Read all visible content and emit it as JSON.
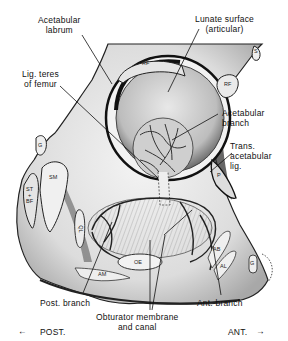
{
  "figure": {
    "labels": {
      "acetabular_labrum": "Acetabular\nlabrum",
      "lunate_surface": "Lunate surface\n(articular)",
      "lig_teres": "Lig. teres\nof femur",
      "acetabular_branch": "Acetabular\nbranch",
      "trans_acetabular_lig": "Trans.\nacetabular\nlig.",
      "post_branch": "Post. branch",
      "obturator_membrane": "Obturator membrane\nand canal",
      "ant_branch": "Ant. branch"
    },
    "muscle_abbreviations": {
      "rf_upper": "RF",
      "rf_right": "RF",
      "s": "S",
      "g": "G",
      "sm": "SM",
      "st_bf": "ST\n+\nBF",
      "ql": "QL",
      "oe": "OE",
      "am": "AM",
      "ab": "AB",
      "al": "AL",
      "p": "P",
      "g_right": "G"
    },
    "orientation": {
      "posterior": "POST.",
      "anterior": "ANT.",
      "left_arrow": "←",
      "right_arrow": "→"
    }
  }
}
